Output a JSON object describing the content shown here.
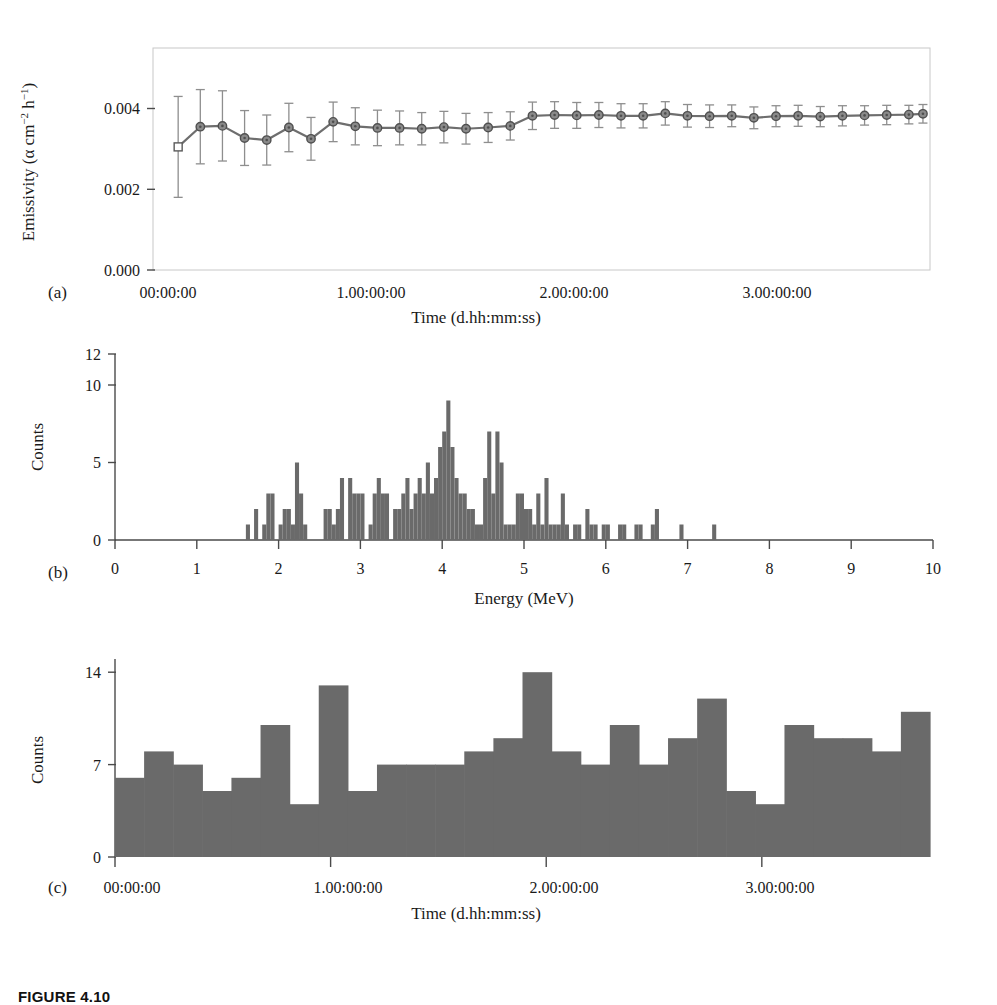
{
  "figure": {
    "caption_label": "FIGURE 4.10",
    "panel_a_letter": "(a)",
    "panel_b_letter": "(b)",
    "panel_c_letter": "(c)",
    "colors": {
      "bar_fill": "#6a6a6a",
      "line": "#6e6e6e",
      "marker_fill": "#8a8a8a",
      "marker_stroke": "#4f4f4f",
      "error_bar": "#8e8e8e",
      "axis": "#4a4a4a",
      "frame": "#c8c8c8",
      "background": "#ffffff"
    }
  },
  "chart_data": [
    {
      "id": "panel-a",
      "type": "line",
      "title": "",
      "xlabel": "Time (d.hh:mm:ss)",
      "ylabel": "Emissivity (α cm⁻² h⁻¹)",
      "ylabel_parts": {
        "base": "Emissivity (α cm",
        "sup1": "−2",
        "mid": " h",
        "sup2": "−1",
        "tail": ")"
      },
      "xtick_labels": [
        "00:00:00",
        "1.00:00:00",
        "2.00:00:00",
        "3.00:00:00"
      ],
      "xtick_values": [
        0,
        1,
        2,
        3
      ],
      "ytick_labels": [
        "0.000",
        "0.002",
        "0.004"
      ],
      "ytick_values": [
        0.0,
        0.002,
        0.004
      ],
      "xlim": [
        -0.08,
        3.78
      ],
      "ylim": [
        0.0,
        0.0055
      ],
      "grid": false,
      "legend": "none",
      "marker_style": "circle-with-dot",
      "first_marker_style": "open-square",
      "series": [
        {
          "name": "Cumulative emissivity",
          "x": [
            0.045,
            0.155,
            0.265,
            0.375,
            0.485,
            0.595,
            0.705,
            0.815,
            0.925,
            1.035,
            1.145,
            1.255,
            1.365,
            1.475,
            1.585,
            1.695,
            1.805,
            1.915,
            2.025,
            2.135,
            2.245,
            2.355,
            2.465,
            2.575,
            2.685,
            2.795,
            2.905,
            3.015,
            3.125,
            3.235,
            3.345,
            3.455,
            3.565,
            3.675,
            3.745
          ],
          "y": [
            0.00305,
            0.00355,
            0.00357,
            0.00327,
            0.00322,
            0.00353,
            0.00325,
            0.00367,
            0.00356,
            0.00352,
            0.00352,
            0.0035,
            0.00354,
            0.0035,
            0.00353,
            0.00357,
            0.00382,
            0.00384,
            0.00383,
            0.00384,
            0.00382,
            0.00382,
            0.00388,
            0.00382,
            0.00381,
            0.00382,
            0.00377,
            0.00381,
            0.00382,
            0.0038,
            0.00382,
            0.00383,
            0.00384,
            0.00385,
            0.00387
          ],
          "yerr": [
            0.00125,
            0.00092,
            0.00087,
            0.00068,
            0.00062,
            0.0006,
            0.00053,
            0.00049,
            0.00046,
            0.00044,
            0.00042,
            0.0004,
            0.00039,
            0.00038,
            0.00037,
            0.00035,
            0.00034,
            0.00033,
            0.00032,
            0.00031,
            0.0003,
            0.0003,
            0.00029,
            0.00028,
            0.00028,
            0.00027,
            0.00027,
            0.00026,
            0.00026,
            0.00025,
            0.00025,
            0.00024,
            0.00024,
            0.00023,
            0.00023
          ]
        }
      ]
    },
    {
      "id": "panel-b",
      "type": "bar",
      "title": "",
      "xlabel": "Energy (MeV)",
      "ylabel": "Counts",
      "xtick_labels": [
        "0",
        "1",
        "2",
        "3",
        "4",
        "5",
        "6",
        "7",
        "8",
        "9",
        "10"
      ],
      "xtick_values": [
        0,
        1,
        2,
        3,
        4,
        5,
        6,
        7,
        8,
        9,
        10
      ],
      "ytick_labels": [
        "0",
        "5",
        "10",
        "12"
      ],
      "ytick_values": [
        0,
        5,
        10,
        12
      ],
      "xlim": [
        0,
        10
      ],
      "ylim": [
        0,
        12
      ],
      "bin_width": 0.05,
      "grid": false,
      "legend": "none",
      "bin_starts_from": 0.0,
      "values": [
        0,
        0,
        0,
        0,
        0,
        0,
        0,
        0,
        0,
        0,
        0,
        0,
        0,
        0,
        0,
        0,
        0,
        0,
        0,
        0,
        0,
        0,
        0,
        0,
        0,
        0,
        0,
        0,
        0,
        0,
        0,
        0,
        1,
        0,
        2,
        0,
        1,
        3,
        3,
        0,
        1,
        2,
        2,
        1,
        5,
        3,
        1,
        0,
        0,
        0,
        0,
        2,
        2,
        1,
        2,
        4,
        0,
        4,
        3,
        3,
        3,
        0,
        1,
        3,
        4,
        3,
        3,
        0,
        2,
        2,
        3,
        4,
        2,
        3,
        4,
        3,
        5,
        3,
        4,
        6,
        7,
        9,
        6,
        4,
        3,
        3,
        2,
        2,
        1,
        1,
        4,
        7,
        3,
        7,
        5,
        1,
        1,
        1,
        3,
        3,
        2,
        2,
        1,
        3,
        1,
        4,
        1,
        1,
        1,
        3,
        1,
        0,
        1,
        1,
        0,
        2,
        1,
        1,
        0,
        1,
        1,
        0,
        0,
        1,
        1,
        0,
        0,
        1,
        1,
        0,
        0,
        1,
        2,
        0,
        0,
        0,
        0,
        0,
        1,
        0,
        0,
        0,
        0,
        0,
        0,
        0,
        1,
        0,
        0,
        0,
        0,
        0,
        0,
        0,
        0,
        0,
        0,
        0,
        0,
        0,
        0,
        0,
        0,
        0,
        0,
        0,
        0,
        0,
        0,
        0,
        0,
        0,
        0,
        0,
        0,
        0,
        0,
        0,
        0,
        0,
        0,
        0,
        0,
        0,
        0,
        0,
        0,
        0,
        0,
        0,
        0,
        0,
        0,
        0,
        0,
        0,
        0,
        0,
        0,
        0
      ],
      "notable_peaks": [
        {
          "energy": 4.1,
          "counts": 9
        },
        {
          "energy": 4.55,
          "counts": 7
        },
        {
          "energy": 4.65,
          "counts": 7
        },
        {
          "energy": 2.2,
          "counts": 5
        },
        {
          "energy": 3.8,
          "counts": 7
        }
      ]
    },
    {
      "id": "panel-c",
      "type": "bar",
      "title": "",
      "xlabel": "Time (d.hh:mm:ss)",
      "ylabel": "Counts",
      "xtick_labels": [
        "00:00:00",
        "1.00:00:00",
        "2.00:00:00",
        "3.00:00:00"
      ],
      "xtick_values": [
        0,
        1,
        2,
        3
      ],
      "ytick_labels": [
        "0",
        "7",
        "14"
      ],
      "ytick_values": [
        0,
        7,
        14
      ],
      "xlim": [
        0,
        3.78
      ],
      "ylim": [
        0,
        15
      ],
      "bin_width": 0.135,
      "grid": false,
      "legend": "none",
      "values": [
        6,
        8,
        7,
        5,
        6,
        10,
        4,
        13,
        5,
        7,
        7,
        7,
        8,
        9,
        14,
        8,
        7,
        10,
        7,
        9,
        12,
        5,
        4,
        10,
        9,
        9,
        8,
        11
      ]
    }
  ]
}
